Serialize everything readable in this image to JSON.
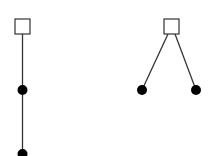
{
  "diagram": {
    "stroke_color": "#333333",
    "fill_color": "#000000",
    "box_fill": "#ffffff",
    "trees": [
      {
        "name": "chain-tree",
        "root": {
          "x": 15,
          "y": 19,
          "w": 15,
          "h": 15
        },
        "edges": [
          {
            "x1": 22.5,
            "y1": 34,
            "x2": 22.5,
            "y2": 90
          },
          {
            "x1": 22.5,
            "y1": 90,
            "x2": 22.5,
            "y2": 154
          }
        ],
        "nodes": [
          {
            "cx": 22.5,
            "cy": 90,
            "r": 5
          },
          {
            "cx": 22.5,
            "cy": 154,
            "r": 5
          }
        ]
      },
      {
        "name": "fork-tree",
        "root": {
          "x": 164,
          "y": 19,
          "w": 15,
          "h": 15
        },
        "edges": [
          {
            "x1": 168,
            "y1": 34,
            "x2": 142,
            "y2": 90
          },
          {
            "x1": 175,
            "y1": 34,
            "x2": 196,
            "y2": 90
          }
        ],
        "nodes": [
          {
            "cx": 142,
            "cy": 90,
            "r": 5
          },
          {
            "cx": 196,
            "cy": 90,
            "r": 5
          }
        ]
      }
    ]
  }
}
